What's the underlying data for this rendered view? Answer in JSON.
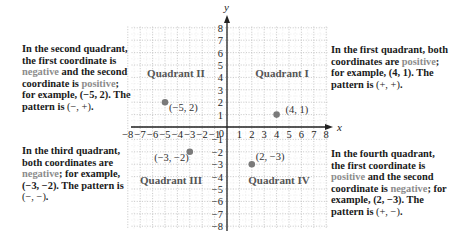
{
  "axes": {
    "x_label": "x",
    "y_label": "y",
    "x_ticks_neg": [
      "−8",
      "−7",
      "−6",
      "−5",
      "−4",
      "−3",
      "−2",
      "−1"
    ],
    "x_ticks_pos": [
      "1",
      "2",
      "3",
      "4",
      "5",
      "6",
      "7",
      "8"
    ],
    "origin_label": "0",
    "y_ticks_pos": [
      "1",
      "2",
      "3",
      "4",
      "5",
      "6",
      "7",
      "8"
    ],
    "y_ticks_neg": [
      "−1",
      "−2",
      "−3",
      "−4",
      "−5",
      "−6",
      "−7",
      "−8"
    ]
  },
  "quadrants": {
    "q1": "Quadrant I",
    "q2": "Quadrant II",
    "q3": "Quadrant III",
    "q4": "Quadrant IV"
  },
  "points": [
    {
      "x": 4,
      "y": 1,
      "label": "(4, 1)"
    },
    {
      "x": -5,
      "y": 2,
      "label": "(−5, 2)"
    },
    {
      "x": -3,
      "y": -2,
      "label": "(−3, −2)"
    },
    {
      "x": 2,
      "y": -3,
      "label": "(2, −3)"
    }
  ],
  "notes": {
    "second": {
      "a": "In the second quadrant, the first coordinate is ",
      "neg": "negative",
      "b": " and the second coordinate is ",
      "pos": "positive",
      "c": "; for example, (−5, 2). The pattern is ",
      "pattern": "(−, +)",
      "d": "."
    },
    "third": {
      "a": "In the third quadrant, both coordinates are ",
      "neg": "negative",
      "b": "; for example, (−3, −2). The pattern is ",
      "pattern": "(−, −)",
      "c": "."
    },
    "first": {
      "a": "In the first quadrant, both coordinates are ",
      "pos": "positive",
      "b": "; for example, (4, 1). The pattern is ",
      "pattern": "(+, +)",
      "c": "."
    },
    "fourth": {
      "a": "In the fourth quadrant, the first coordinate is ",
      "pos": "positive",
      "b": " and the second coordinate is ",
      "neg": "negative",
      "c": "; for example, (2, −3). The pattern is ",
      "pattern": "(+, −)",
      "d": "."
    }
  },
  "colors": {
    "highlight": "#8c8c8c",
    "point": "#7a7a7a",
    "grid": "#b8b8b8",
    "axis": "#222222"
  }
}
